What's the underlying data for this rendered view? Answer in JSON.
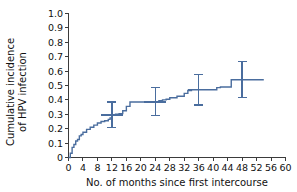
{
  "chart_data": {
    "type": "line",
    "title": "",
    "subtitle": "",
    "xlabel": "No. of months since first intercourse",
    "ylabel_line1": "Cumulative incidence",
    "ylabel_line2": "of HPV infection",
    "xlim": [
      0,
      60
    ],
    "ylim": [
      0,
      1.0
    ],
    "grid": false,
    "legend": "none",
    "series_color": "#4a6d9e",
    "axis_color": "#3b3b3b",
    "x_ticks": [
      0,
      4,
      8,
      12,
      16,
      20,
      24,
      28,
      32,
      36,
      40,
      44,
      48,
      52,
      56,
      60
    ],
    "x_tick_labels": [
      "0",
      "4",
      "8",
      "12",
      "16",
      "20",
      "24",
      "28",
      "32",
      "36",
      "40",
      "44",
      "48",
      "52",
      "56",
      "60"
    ],
    "y_ticks": [
      0,
      0.1,
      0.2,
      0.3,
      0.4,
      0.5,
      0.6,
      0.7,
      0.8,
      0.9,
      1.0
    ],
    "y_tick_labels": [
      "0",
      "0.1",
      "0.2",
      "0.3",
      "0.4",
      "0.5",
      "0.6",
      "0.7",
      "0.8",
      "0.9",
      "1.0"
    ],
    "series": [
      {
        "name": "Cumulative incidence of HPV infection",
        "style": "kaplan-meier-step",
        "x": [
          0,
          0.5,
          1,
          1.5,
          2,
          2.5,
          3,
          3.5,
          4,
          5,
          6,
          7,
          8,
          9,
          10,
          11,
          11.5,
          12,
          13,
          14,
          15,
          16,
          17,
          24,
          25,
          26,
          27,
          28,
          30,
          32,
          33,
          34,
          40,
          41,
          42,
          44,
          45,
          54
        ],
        "y": [
          0,
          0.03,
          0.07,
          0.09,
          0.115,
          0.125,
          0.15,
          0.16,
          0.175,
          0.195,
          0.21,
          0.225,
          0.24,
          0.25,
          0.255,
          0.265,
          0.275,
          0.295,
          0.3,
          0.305,
          0.325,
          0.355,
          0.385,
          0.385,
          0.395,
          0.4,
          0.405,
          0.415,
          0.425,
          0.445,
          0.465,
          0.47,
          0.47,
          0.485,
          0.49,
          0.49,
          0.54,
          0.54
        ]
      }
    ],
    "error_bars": [
      {
        "x": 12,
        "y": 0.295,
        "low": 0.21,
        "high": 0.385
      },
      {
        "x": 24,
        "y": 0.385,
        "low": 0.29,
        "high": 0.485
      },
      {
        "x": 36,
        "y": 0.47,
        "low": 0.365,
        "high": 0.575
      },
      {
        "x": 48,
        "y": 0.54,
        "low": 0.415,
        "high": 0.665
      }
    ]
  }
}
